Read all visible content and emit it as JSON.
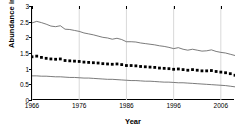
{
  "chart_data": {
    "type": "line",
    "title": "",
    "xlabel": "Year",
    "ylabel": "Abundance index",
    "xlim": [
      1966,
      2009
    ],
    "ylim": [
      0,
      3
    ],
    "yticks": [
      0,
      0.5,
      1,
      1.5,
      2,
      2.5,
      3
    ],
    "ytick_labels": [
      "0",
      "0.5",
      "1",
      "1.5",
      "2",
      "2.5",
      "3"
    ],
    "xticks": [
      1966,
      1976,
      1986,
      1996,
      2006
    ],
    "xtick_labels": [
      "1966",
      "1976",
      "1986",
      "1996",
      "2006"
    ],
    "grid": "vertical-only",
    "legend": "none",
    "colors": {
      "axis": "#000000",
      "marker": "#000000",
      "bound_line": "#595959",
      "gridline": "#d9d9d9"
    },
    "x": [
      1966,
      1967,
      1968,
      1969,
      1970,
      1971,
      1972,
      1973,
      1974,
      1975,
      1976,
      1977,
      1978,
      1979,
      1980,
      1981,
      1982,
      1983,
      1984,
      1985,
      1986,
      1987,
      1988,
      1989,
      1990,
      1991,
      1992,
      1993,
      1994,
      1995,
      1996,
      1997,
      1998,
      1999,
      2000,
      2001,
      2002,
      2003,
      2004,
      2005,
      2006,
      2007,
      2008,
      2009
    ],
    "series": [
      {
        "name": "Upper confidence bound",
        "style": "line",
        "values": [
          2.46,
          2.51,
          2.47,
          2.42,
          2.36,
          2.34,
          2.37,
          2.26,
          2.25,
          2.22,
          2.19,
          2.14,
          2.11,
          2.08,
          2.04,
          2.0,
          1.98,
          1.94,
          1.97,
          1.93,
          1.86,
          1.86,
          1.85,
          1.82,
          1.8,
          1.78,
          1.76,
          1.73,
          1.71,
          1.68,
          1.64,
          1.67,
          1.62,
          1.59,
          1.62,
          1.59,
          1.56,
          1.57,
          1.6,
          1.55,
          1.52,
          1.5,
          1.46,
          1.42
        ]
      },
      {
        "name": "Abundance index (point estimate)",
        "style": "markers",
        "values": [
          1.38,
          1.4,
          1.36,
          1.33,
          1.31,
          1.3,
          1.31,
          1.26,
          1.25,
          1.24,
          1.23,
          1.21,
          1.2,
          1.19,
          1.18,
          1.16,
          1.15,
          1.14,
          1.15,
          1.13,
          1.1,
          1.1,
          1.09,
          1.07,
          1.06,
          1.05,
          1.04,
          1.02,
          1.01,
          1.0,
          0.98,
          0.99,
          0.97,
          0.95,
          0.97,
          0.95,
          0.93,
          0.93,
          0.94,
          0.91,
          0.89,
          0.87,
          0.84,
          0.79
        ]
      },
      {
        "name": "Lower confidence bound",
        "style": "line",
        "values": [
          0.77,
          0.77,
          0.76,
          0.76,
          0.75,
          0.74,
          0.74,
          0.73,
          0.72,
          0.72,
          0.71,
          0.7,
          0.7,
          0.69,
          0.68,
          0.67,
          0.66,
          0.66,
          0.65,
          0.64,
          0.63,
          0.62,
          0.62,
          0.61,
          0.6,
          0.6,
          0.59,
          0.58,
          0.57,
          0.57,
          0.56,
          0.55,
          0.55,
          0.54,
          0.53,
          0.52,
          0.51,
          0.5,
          0.49,
          0.48,
          0.47,
          0.46,
          0.44,
          0.42
        ]
      }
    ]
  }
}
